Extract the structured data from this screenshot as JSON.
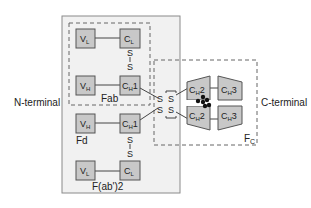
{
  "labels": {
    "n_terminal": "N-terminal",
    "c_terminal": "C-terminal",
    "fab": "Fab",
    "fd": "Fd",
    "fab2": "F(ab')2",
    "fc_main": "F",
    "fc_sub": "C"
  },
  "domains": {
    "vl_top": {
      "main": "V",
      "sub": "L"
    },
    "cl_top": {
      "main": "C",
      "sub": "L"
    },
    "vh_top": {
      "main": "V",
      "sub": "H"
    },
    "ch1_top": {
      "main": "C",
      "sub": "H",
      "suffix": "1"
    },
    "vh_bot": {
      "main": "V",
      "sub": "H"
    },
    "ch1_bot": {
      "main": "C",
      "sub": "H",
      "suffix": "1"
    },
    "vl_bot": {
      "main": "V",
      "sub": "L"
    },
    "cl_bot": {
      "main": "C",
      "sub": "L"
    },
    "ch2_top": {
      "main": "C",
      "sub": "H",
      "suffix": "2"
    },
    "ch3_top": {
      "main": "C",
      "sub": "H",
      "suffix": "3"
    },
    "ch2_bot": {
      "main": "C",
      "sub": "H",
      "suffix": "2"
    },
    "ch3_bot": {
      "main": "C",
      "sub": "H",
      "suffix": "3"
    }
  },
  "disulfide": "S",
  "colors": {
    "domain_fill": "#c8c8c8",
    "domain_stroke": "#555555",
    "panel_fill": "#f1f1f1",
    "panel_stroke": "#777777",
    "dash": "#666666",
    "glycan": "#111111"
  }
}
